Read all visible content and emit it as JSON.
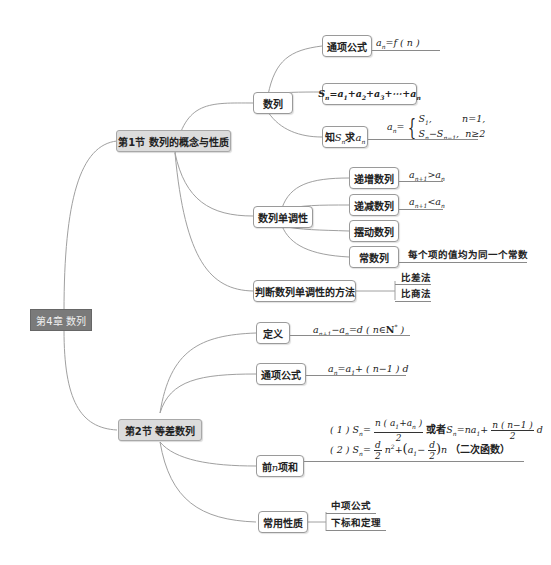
{
  "root": {
    "label": "第4章 数列"
  },
  "sections": [
    {
      "label": "第1节  数列的概念与性质",
      "children": [
        {
          "label": "数列",
          "children": [
            {
              "label": "通项公式",
              "formula": "aₙ=f(n)"
            },
            {
              "label": "Sₙ=a₁+a₂+a₃+⋯+aₙ"
            },
            {
              "label": "知Sₙ求aₙ",
              "formula": "aₙ={S₁, n=1; Sₙ−Sₙ₋₁, n≥2"
            }
          ]
        },
        {
          "label": "数列单调性",
          "children": [
            {
              "label": "递增数列",
              "formula": "aₙ₊₁>aₙ"
            },
            {
              "label": "递减数列",
              "formula": "aₙ₊₁<aₙ"
            },
            {
              "label": "摆动数列"
            },
            {
              "label": "常数列",
              "note": "每个项的值均为同一个常数"
            }
          ]
        },
        {
          "label": "判断数列单调性的方法",
          "children": [
            {
              "label": "比差法"
            },
            {
              "label": "比商法"
            }
          ]
        }
      ]
    },
    {
      "label": "第2节  等差数列",
      "children": [
        {
          "label": "定义",
          "formula": "aₙ₊₁−aₙ=d (n∈N*)"
        },
        {
          "label": "通项公式",
          "formula": "aₙ=a₁+(n−1)d"
        },
        {
          "label": "前n项和",
          "formulas": [
            "(1) Sₙ=n(a₁+aₙ)/2 或者Sₙ=na₁+n(n−1)/2·d",
            "(2) Sₙ=d/2·n²+(a₁−d/2)n (二次函数)"
          ]
        },
        {
          "label": "常用性质",
          "children": [
            {
              "label": "中项公式"
            },
            {
              "label": "下标和定理"
            }
          ]
        }
      ]
    }
  ],
  "text": {
    "zhi_prefix": "知",
    "qiu": "求",
    "huozhe": "或者",
    "erci": "（二次函数）",
    "changshu_note": "每个项的值均为同一个常数",
    "qian": "前",
    "xianghe": "项和"
  },
  "colors": {
    "root_fill": "#7a7a7a",
    "section_fill": "#dcdcdc",
    "node_border": "#9a9a9a",
    "link": "#9a9a9a"
  }
}
